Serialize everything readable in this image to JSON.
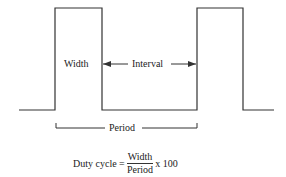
{
  "diagram": {
    "type": "pulse-waveform",
    "stroke_color": "#333333",
    "background": "#ffffff",
    "labels": {
      "width": "Width",
      "interval": "Interval",
      "period": "Period"
    },
    "formula": {
      "lhs": "Duty cycle =",
      "numerator": "Width",
      "denominator": "Period",
      "rhs": "x 100"
    },
    "waveform": {
      "pulses": 2,
      "baseline_y": 110,
      "high_y": 8,
      "points": [
        [
          19,
          110
        ],
        [
          55,
          110
        ],
        [
          55,
          8
        ],
        [
          102,
          8
        ],
        [
          102,
          110
        ],
        [
          197,
          110
        ],
        [
          197,
          8
        ],
        [
          243,
          8
        ],
        [
          243,
          110
        ],
        [
          274,
          110
        ]
      ]
    }
  }
}
